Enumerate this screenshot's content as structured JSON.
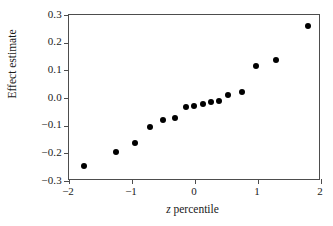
{
  "chart_data": {
    "type": "scatter",
    "title": "",
    "xlabel": "z percentile",
    "xlabel_var": "z",
    "xlabel_rest": " percentile",
    "ylabel": "Effect estimate",
    "xlim": [
      -2,
      2
    ],
    "ylim": [
      -0.3,
      0.3
    ],
    "xticks": [
      -2,
      -1,
      0,
      1,
      2
    ],
    "xticklabels": [
      "−2",
      "−1",
      "0",
      "1",
      "2"
    ],
    "yticks": [
      -0.3,
      -0.2,
      -0.1,
      0.0,
      0.1,
      0.2,
      0.3
    ],
    "yticklabels": [
      "−0.3",
      "−0.2",
      "−0.1",
      "0.0",
      "0.1",
      "0.2",
      "0.3"
    ],
    "grid": false,
    "legend": false,
    "marker": "filled-circle",
    "marker_color": "#000000",
    "frame_color": "#4d4d4d",
    "series": [
      {
        "name": "Effect estimate vs z percentile",
        "points": [
          {
            "x": -1.76,
            "y": -0.247
          },
          {
            "x": -1.26,
            "y": -0.194
          },
          {
            "x": -0.95,
            "y": -0.163
          },
          {
            "x": -0.71,
            "y": -0.104
          },
          {
            "x": -0.51,
            "y": -0.079
          },
          {
            "x": -0.32,
            "y": -0.072
          },
          {
            "x": -0.15,
            "y": -0.031
          },
          {
            "x": -0.01,
            "y": -0.029
          },
          {
            "x": 0.12,
            "y": -0.02
          },
          {
            "x": 0.26,
            "y": -0.013
          },
          {
            "x": 0.38,
            "y": -0.011
          },
          {
            "x": 0.53,
            "y": 0.01
          },
          {
            "x": 0.74,
            "y": 0.023
          },
          {
            "x": 0.97,
            "y": 0.116
          },
          {
            "x": 1.28,
            "y": 0.139
          },
          {
            "x": 1.79,
            "y": 0.261
          }
        ]
      }
    ]
  }
}
